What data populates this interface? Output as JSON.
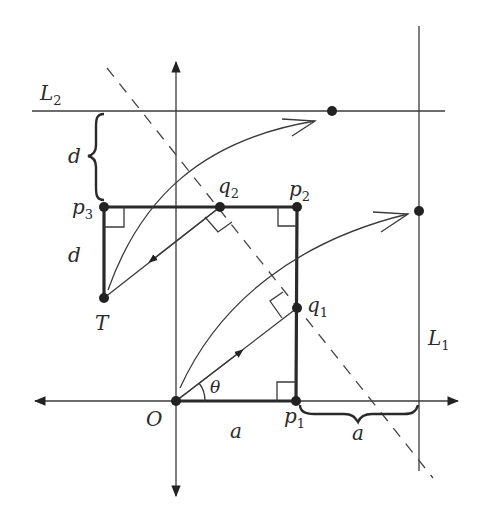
{
  "figure": {
    "type": "geometry-diagram",
    "labels": {
      "L2": "L",
      "L2_sub": "2",
      "L1": "L",
      "L1_sub": "1",
      "p1": "p",
      "p1_sub": "1",
      "p2": "p",
      "p2_sub": "2",
      "p3": "p",
      "p3_sub": "3",
      "q1": "q",
      "q1_sub": "1",
      "q2": "q",
      "q2_sub": "2",
      "T": "T",
      "O": "O",
      "theta": "θ",
      "d_upper": "d",
      "d_lower": "d",
      "a_left": "a",
      "a_right": "a"
    },
    "points": {
      "O": [
        176,
        401
      ],
      "p1": [
        296,
        401
      ],
      "p2": [
        297,
        207
      ],
      "p3": [
        104,
        207
      ],
      "q1": [
        297,
        308
      ],
      "q2": [
        220,
        207
      ],
      "T": [
        104,
        298
      ],
      "L2_point": [
        332,
        111
      ],
      "L1_point": [
        419,
        211
      ]
    },
    "colors": {
      "ink": "#2a2a2a",
      "background": "#ffffff"
    }
  }
}
